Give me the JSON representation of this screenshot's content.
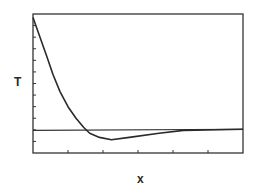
{
  "chart_data": {
    "type": "line",
    "title": "",
    "xlabel": "x",
    "ylabel": "T",
    "xlim": [
      0,
      6
    ],
    "ylim": [
      -1,
      11
    ],
    "x_ticks_count": 5,
    "y_ticks_count": 11,
    "grid": false,
    "legend": "none",
    "series": [
      {
        "name": "T(x)",
        "x": [
          0,
          0.2,
          0.4,
          0.57,
          0.77,
          1.0,
          1.23,
          1.45,
          1.62,
          1.9,
          2.24,
          2.75,
          3.6,
          4.3,
          6.0
        ],
        "y": [
          10.7,
          9.0,
          7.3,
          5.8,
          4.3,
          3.0,
          2.0,
          1.2,
          0.7,
          0.35,
          0.15,
          0.35,
          0.7,
          0.95,
          1.05
        ]
      },
      {
        "name": "reference",
        "x": [
          0,
          6
        ],
        "y": [
          0.95,
          1.05
        ]
      }
    ]
  }
}
